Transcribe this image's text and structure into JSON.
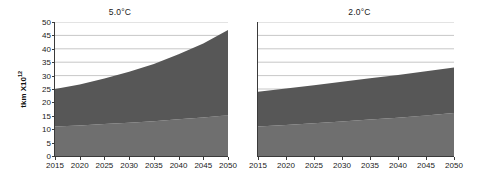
{
  "chart_data": [
    {
      "type": "area",
      "title": "5.0°C",
      "xlabel": "",
      "ylabel": "tkm X10",
      "ylabel_exponent": "12",
      "x": [
        2015,
        2020,
        2025,
        2030,
        2035,
        2040,
        2045,
        2050
      ],
      "xlim": [
        2015,
        2050
      ],
      "ylim": [
        0,
        50
      ],
      "yticks": [
        0,
        5,
        10,
        15,
        20,
        25,
        30,
        35,
        40,
        45,
        50
      ],
      "xticks": [
        2015,
        2020,
        2025,
        2030,
        2035,
        2040,
        2045,
        2050
      ],
      "grid": true,
      "legend": "none",
      "stacked": true,
      "series": [
        {
          "name": "lower-band",
          "color": "#6f6f6f",
          "values": [
            11.0,
            11.4,
            11.9,
            12.4,
            13.0,
            13.7,
            14.4,
            15.2
          ]
        },
        {
          "name": "upper-band",
          "color": "#575757",
          "values": [
            14.0,
            15.3,
            17.0,
            19.0,
            21.3,
            24.3,
            27.6,
            31.8
          ]
        }
      ],
      "totals": [
        25.0,
        26.7,
        28.9,
        31.4,
        34.3,
        38.0,
        42.0,
        47.0
      ]
    },
    {
      "type": "area",
      "title": "2.0°C",
      "xlabel": "",
      "ylabel": "",
      "x": [
        2015,
        2020,
        2025,
        2030,
        2035,
        2040,
        2045,
        2050
      ],
      "xlim": [
        2015,
        2050
      ],
      "ylim": [
        0,
        50
      ],
      "yticks": [
        0,
        5,
        10,
        15,
        20,
        25,
        30,
        35,
        40,
        45,
        50
      ],
      "xticks": [
        2015,
        2020,
        2025,
        2030,
        2035,
        2040,
        2045,
        2050
      ],
      "grid": true,
      "legend": "none",
      "stacked": true,
      "series": [
        {
          "name": "lower-band",
          "color": "#6f6f6f",
          "values": [
            11.0,
            11.6,
            12.2,
            12.9,
            13.6,
            14.3,
            15.1,
            16.0
          ]
        },
        {
          "name": "upper-band",
          "color": "#575757",
          "values": [
            13.0,
            13.6,
            14.2,
            14.8,
            15.4,
            15.9,
            16.5,
            17.0
          ]
        }
      ],
      "totals": [
        24.0,
        25.2,
        26.4,
        27.7,
        29.0,
        30.2,
        31.6,
        33.0
      ]
    }
  ],
  "axis": {
    "y_label_text": "tkm X10",
    "y_label_exponent": "12"
  }
}
